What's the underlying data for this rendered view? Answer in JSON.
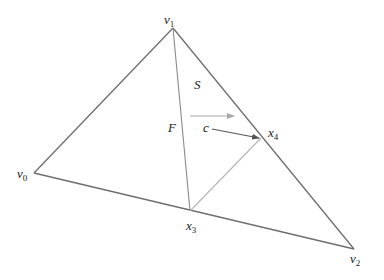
{
  "diagram": {
    "type": "geometric-figure",
    "colors": {
      "edge": "#6e6e6e",
      "inner_edge": "#8a8a8a",
      "light_edge": "#b4b4b4",
      "light_arrow": "#a8a8a8",
      "dark_arrow": "#555555",
      "text": "#1a1a1a"
    },
    "vertices": {
      "v0": {
        "x": 34,
        "y": 173,
        "label": "v",
        "sub": "0"
      },
      "v1": {
        "x": 173,
        "y": 28,
        "label": "v",
        "sub": "1"
      },
      "v2": {
        "x": 354,
        "y": 249,
        "label": "v",
        "sub": "2"
      },
      "x3": {
        "x": 190,
        "y": 211,
        "label": "x",
        "sub": "3"
      },
      "x4": {
        "x": 261,
        "y": 138,
        "label": "x",
        "sub": "4"
      }
    },
    "edges": [
      {
        "from": "v0",
        "to": "v1",
        "style": "edge"
      },
      {
        "from": "v1",
        "to": "v2",
        "style": "edge"
      },
      {
        "from": "v0",
        "to": "v2",
        "style": "edge"
      },
      {
        "from": "v1",
        "to": "x3",
        "style": "inner_edge"
      },
      {
        "from": "x3",
        "to": "x4",
        "style": "light_edge"
      }
    ],
    "arrows": [
      {
        "name": "direction-arrow",
        "from": [
          190,
          116
        ],
        "to": [
          234,
          116
        ],
        "style": "light_arrow"
      },
      {
        "name": "c-arrow",
        "from": [
          212,
          129
        ],
        "to": [
          260,
          138
        ],
        "style": "dark_arrow"
      }
    ],
    "region_labels": {
      "S": "S",
      "F": "F",
      "c": "c"
    }
  }
}
